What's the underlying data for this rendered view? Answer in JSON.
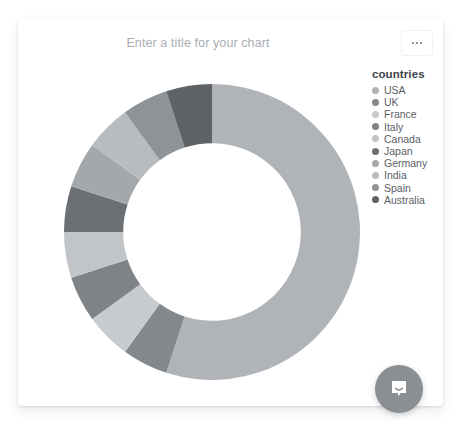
{
  "card": {
    "title_placeholder": "Enter a title for your chart",
    "menu_label": "•••",
    "menu_icon": "ellipsis-icon"
  },
  "legend": {
    "title": "countries",
    "items": [
      {
        "label": "USA",
        "color": "#b0b4b8"
      },
      {
        "label": "UK",
        "color": "#83888d"
      },
      {
        "label": "France",
        "color": "#c8cbce"
      },
      {
        "label": "Italy",
        "color": "#7e8388"
      },
      {
        "label": "Canada",
        "color": "#c2c5c8"
      },
      {
        "label": "Japan",
        "color": "#6b7075"
      },
      {
        "label": "Germany",
        "color": "#a4a8ac"
      },
      {
        "label": "India",
        "color": "#b8bcbf"
      },
      {
        "label": "Spain",
        "color": "#8e9398"
      },
      {
        "label": "Australia",
        "color": "#5e6368"
      }
    ]
  },
  "chat": {
    "icon": "chat-bubble-icon",
    "color": "#8a8f94"
  },
  "chart_data": {
    "type": "pie",
    "variant": "donut",
    "title": "Enter a title for your chart",
    "xlabel": "",
    "ylabel": "",
    "legend_title": "countries",
    "legend_position": "right",
    "grid": false,
    "inner_radius_ratio": 0.6,
    "start_angle_deg": 0,
    "direction": "clockwise",
    "categories": [
      "USA",
      "UK",
      "France",
      "Italy",
      "Canada",
      "Japan",
      "Germany",
      "India",
      "Spain",
      "Australia"
    ],
    "values": [
      55,
      5,
      5,
      5,
      5,
      5,
      5,
      5,
      5,
      5
    ],
    "colors": [
      "#b0b4b8",
      "#83888d",
      "#c8cbce",
      "#7e8388",
      "#c2c5c8",
      "#6b7075",
      "#a4a8ac",
      "#b8bcbf",
      "#8e9398",
      "#5e6368"
    ]
  }
}
